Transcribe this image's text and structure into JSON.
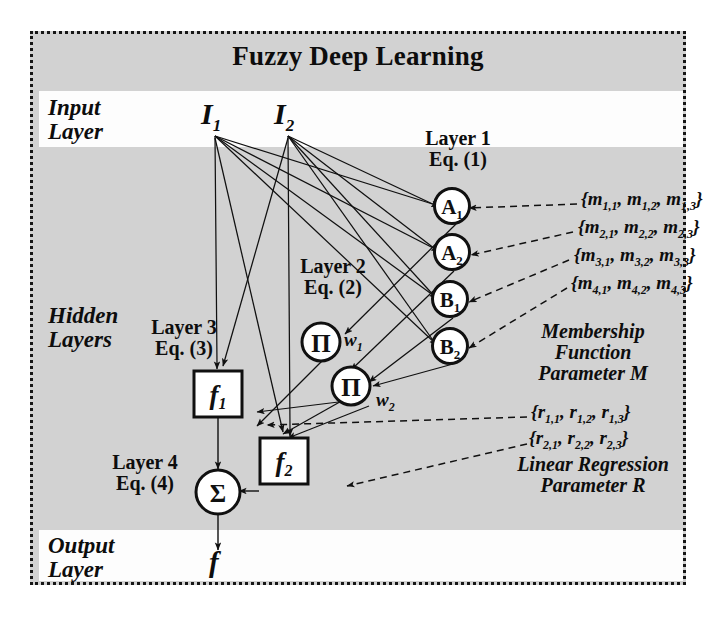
{
  "diagram": {
    "title": "Fuzzy Deep Learning",
    "side_labels": {
      "input": [
        "Input",
        "Layer"
      ],
      "hidden": [
        "Hidden",
        "Layers"
      ],
      "output": [
        "Output",
        "Layer"
      ]
    },
    "layer_labels": [
      {
        "name": "Layer 1",
        "equation": "Eq. (1)"
      },
      {
        "name": "Layer 2",
        "equation": "Eq. (2)"
      },
      {
        "name": "Layer 3",
        "equation": "Eq. (3)"
      },
      {
        "name": "Layer 4",
        "equation": "Eq. (4)"
      }
    ],
    "inputs": [
      {
        "id": "I1",
        "base": "I",
        "sub": "1"
      },
      {
        "id": "I2",
        "base": "I",
        "sub": "2"
      }
    ],
    "membership_nodes": [
      {
        "id": "A1",
        "base": "A",
        "sub": "1"
      },
      {
        "id": "A2",
        "base": "A",
        "sub": "2"
      },
      {
        "id": "B1",
        "base": "B",
        "sub": "1"
      },
      {
        "id": "B2",
        "base": "B",
        "sub": "2"
      }
    ],
    "product_nodes": [
      {
        "id": "prod1",
        "glyph": "Π",
        "weight_base": "w",
        "weight_sub": "1"
      },
      {
        "id": "prod2",
        "glyph": "Π",
        "weight_base": "w",
        "weight_sub": "2"
      }
    ],
    "function_nodes": [
      {
        "id": "f1",
        "base": "f",
        "sub": "1"
      },
      {
        "id": "f2",
        "base": "f",
        "sub": "2"
      }
    ],
    "sum_node": {
      "id": "sum",
      "glyph": "Σ"
    },
    "output": {
      "base": "f",
      "sub": ""
    },
    "membership_parameters": [
      {
        "row": 1,
        "items": [
          "m",
          "1,1",
          "m",
          "1,2",
          "m",
          "1,3"
        ]
      },
      {
        "row": 2,
        "items": [
          "m",
          "2,1",
          "m",
          "2,2",
          "m",
          "2,3"
        ]
      },
      {
        "row": 3,
        "items": [
          "m",
          "3,1",
          "m",
          "3,2",
          "m",
          "3,3"
        ]
      },
      {
        "row": 4,
        "items": [
          "m",
          "4,1",
          "m",
          "4,2",
          "m",
          "4,3"
        ]
      }
    ],
    "regression_parameters": [
      {
        "row": 1,
        "items": [
          "r",
          "1,1",
          "r",
          "1,2",
          "r",
          "1,3"
        ]
      },
      {
        "row": 2,
        "items": [
          "r",
          "2,1",
          "r",
          "2,2",
          "r",
          "2,3"
        ]
      }
    ],
    "membership_caption": [
      "Membership",
      "Function",
      "Parameter M"
    ],
    "regression_caption": [
      "Linear Regression",
      "Parameter R"
    ],
    "colors": {
      "background": "#d2d2d2",
      "band": "#fdfdfd",
      "ink": "#101010",
      "node_fill": "#ffffff",
      "page": "#ffffff"
    }
  }
}
